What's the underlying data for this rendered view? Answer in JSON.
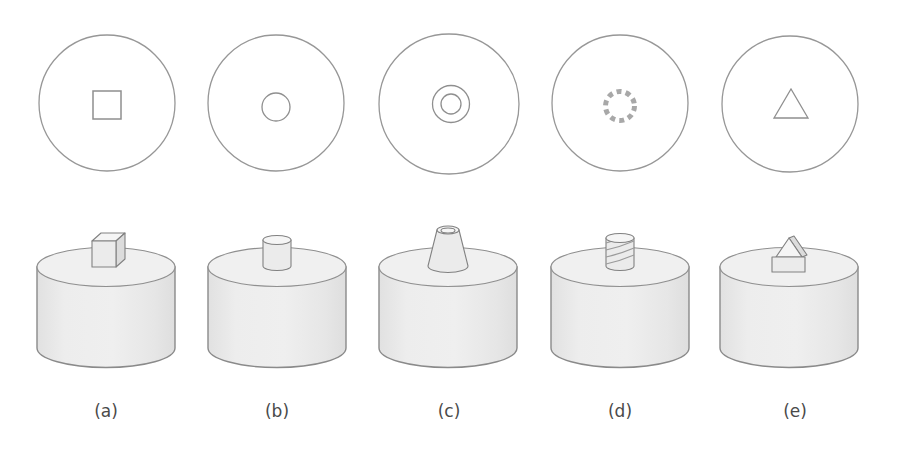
{
  "figure": {
    "background": "#ffffff",
    "columns": [
      {
        "label": "(a)",
        "top_view": "circle-with-square-hole",
        "boss": "cube-boss"
      },
      {
        "label": "(b)",
        "top_view": "circle-with-round-hole",
        "boss": "cylinder-boss"
      },
      {
        "label": "(c)",
        "top_view": "circle-with-concentric-circles",
        "boss": "tapered-cone-boss"
      },
      {
        "label": "(d)",
        "top_view": "circle-with-knurled-hole",
        "boss": "threaded-stud-boss"
      },
      {
        "label": "(e)",
        "top_view": "circle-with-triangle-hole",
        "boss": "triangular-prism-boss"
      }
    ],
    "colors": {
      "outline": "#8f8f8f",
      "circle_fill": "#ffffff",
      "cylinder_fill": "#eaeaea",
      "cylinder_top_fill": "#f0f0f0",
      "boss_shadow_fill": "#dcdcdc",
      "label_color": "#4a4a4a"
    }
  }
}
